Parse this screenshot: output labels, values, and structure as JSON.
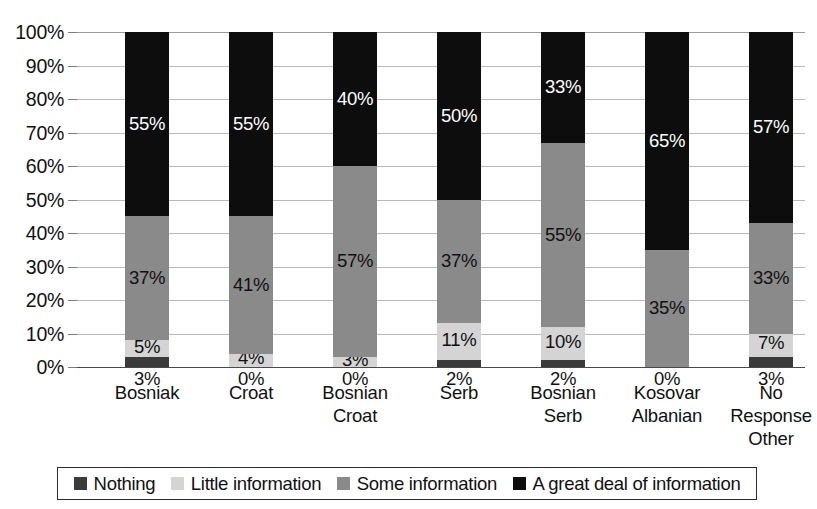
{
  "chart_data": {
    "type": "bar",
    "subtype": "stacked-bar-100-percent",
    "title": "",
    "xlabel": "",
    "ylabel": "",
    "ylim": [
      0,
      100
    ],
    "y_tick_labels": [
      "0%",
      "10%",
      "20%",
      "30%",
      "40%",
      "50%",
      "60%",
      "70%",
      "80%",
      "90%",
      "100%"
    ],
    "y_tick_values": [
      0,
      10,
      20,
      30,
      40,
      50,
      60,
      70,
      80,
      90,
      100
    ],
    "grid": true,
    "legend_position": "bottom",
    "categories": [
      "Bosniak",
      "Croat",
      "Bosnian Croat",
      "Serb",
      "Bosnian Serb",
      "Kosovar Albanian",
      "No Response Other"
    ],
    "category_lines": [
      [
        "Bosniak"
      ],
      [
        "Croat"
      ],
      [
        "Bosnian",
        "Croat"
      ],
      [
        "Serb"
      ],
      [
        "Bosnian",
        "Serb"
      ],
      [
        "Kosovar",
        "Albanian"
      ],
      [
        "No",
        "Response",
        "Other"
      ]
    ],
    "series": [
      {
        "name": "Nothing",
        "color": "#3b3b3b",
        "values": [
          3,
          0,
          0,
          2,
          2,
          0,
          3
        ],
        "labels": [
          "3%",
          "0%",
          "0%",
          "2%",
          "2%",
          "0%",
          "3%"
        ]
      },
      {
        "name": "Little information",
        "color": "#d4d4d4",
        "values": [
          5,
          4,
          3,
          11,
          10,
          0,
          7
        ],
        "labels": [
          "5%",
          "4%",
          "3%",
          "11%",
          "10%",
          "",
          "7%"
        ]
      },
      {
        "name": "Some information",
        "color": "#8a8a8a",
        "values": [
          37,
          41,
          57,
          37,
          55,
          35,
          33
        ],
        "labels": [
          "37%",
          "41%",
          "57%",
          "37%",
          "55%",
          "35%",
          "33%"
        ]
      },
      {
        "name": "A great deal of information",
        "color": "#0d0d0d",
        "values": [
          55,
          55,
          40,
          50,
          33,
          65,
          57
        ],
        "labels": [
          "55%",
          "55%",
          "40%",
          "50%",
          "33%",
          "65%",
          "57%"
        ]
      }
    ]
  },
  "legend": {
    "items": [
      {
        "label": "Nothing",
        "color": "#3b3b3b"
      },
      {
        "label": "Little information",
        "color": "#d4d4d4"
      },
      {
        "label": "Some information",
        "color": "#8a8a8a"
      },
      {
        "label": "A great deal of information",
        "color": "#0d0d0d"
      }
    ]
  }
}
